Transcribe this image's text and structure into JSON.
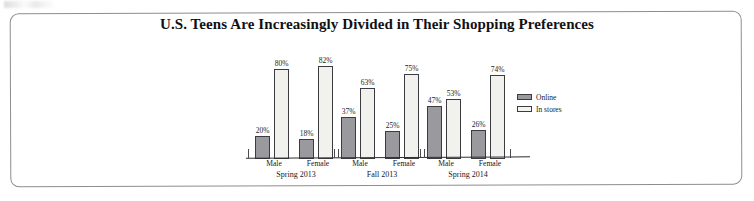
{
  "chart_data": {
    "type": "bar",
    "title": "U.S. Teens Are Increasingly Divided in Their Shopping Preferences",
    "xlabel": "",
    "ylabel": "",
    "ylim": [
      0,
      100
    ],
    "grid": false,
    "legend_position": "right",
    "categories": [
      "Male",
      "Female",
      "Male",
      "Female",
      "Male",
      "Female"
    ],
    "groups": [
      {
        "period": "Spring 2013",
        "bars": [
          {
            "category": "Male",
            "online": 20,
            "in_stores": 80,
            "online_label": "20%",
            "in_stores_label": "80%"
          },
          {
            "category": "Female",
            "online": 18,
            "in_stores": 82,
            "online_label": "18%",
            "in_stores_label": "82%"
          }
        ]
      },
      {
        "period": "Fall 2013",
        "bars": [
          {
            "category": "Male",
            "online": 37,
            "in_stores": 63,
            "online_label": "37%",
            "in_stores_label": "63%"
          },
          {
            "category": "Female",
            "online": 25,
            "in_stores": 75,
            "online_label": "25%",
            "in_stores_label": "75%"
          }
        ]
      },
      {
        "period": "Spring 2014",
        "bars": [
          {
            "category": "Male",
            "online": 47,
            "in_stores": 53,
            "online_label": "47%",
            "in_stores_label": "53%"
          },
          {
            "category": "Female",
            "online": 26,
            "in_stores": 74,
            "online_label": "26%",
            "in_stores_label": "74%"
          }
        ]
      }
    ],
    "series": [
      {
        "name": "Online",
        "values": [
          20,
          18,
          37,
          25,
          47,
          26
        ],
        "color": "#9a9a9e"
      },
      {
        "name": "In stores",
        "values": [
          80,
          82,
          63,
          75,
          53,
          74
        ],
        "color": "#f1f1ee"
      }
    ],
    "legend": [
      {
        "label": "Online",
        "color": "#9a9a9e"
      },
      {
        "label": "In stores",
        "color": "#f1f1ee"
      }
    ]
  }
}
